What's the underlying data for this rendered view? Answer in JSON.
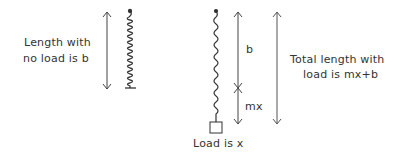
{
  "diagram": {
    "left_label_line1": "Length with",
    "left_label_line2": "no load is b",
    "segment_b_label": "b",
    "segment_mx_label": "mx",
    "load_label": "Load is x",
    "right_label_line1": "Total length with",
    "right_label_line2": "load is mx+b"
  },
  "colors": {
    "stroke": "#333333",
    "background": "#ffffff"
  }
}
